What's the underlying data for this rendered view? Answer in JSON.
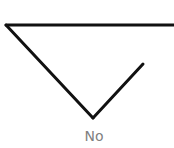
{
  "diagram": {
    "label": "No",
    "colors": {
      "stroke": "#111111",
      "label": "#808080",
      "background": "#ffffff"
    },
    "lines": [
      {
        "name": "top-line",
        "x1": 6,
        "y1": 25,
        "x2": 174,
        "y2": 25
      },
      {
        "name": "left-diagonal",
        "x1": 6,
        "y1": 25,
        "x2": 93,
        "y2": 118
      },
      {
        "name": "right-diagonal",
        "x1": 93,
        "y1": 118,
        "x2": 143,
        "y2": 64
      }
    ]
  }
}
